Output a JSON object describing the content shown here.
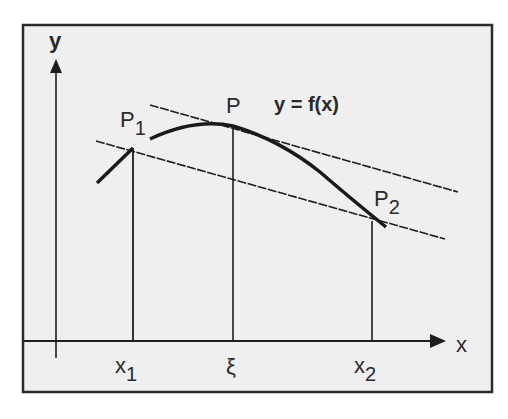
{
  "diagram": {
    "axes": {
      "x_label": "x",
      "y_label": "y"
    },
    "function_label": "y = f(x)",
    "points": {
      "p1": {
        "label": "P",
        "sub": "1"
      },
      "p": {
        "label": "P"
      },
      "p2": {
        "label": "P",
        "sub": "2"
      }
    },
    "x_ticks": {
      "x1": {
        "label": "x",
        "sub": "1"
      },
      "xi": {
        "label": "ξ"
      },
      "x2": {
        "label": "x",
        "sub": "2"
      }
    },
    "colors": {
      "background": "#efefef",
      "ink": "#1e1e1e",
      "frame": "#2b2b2b"
    }
  }
}
